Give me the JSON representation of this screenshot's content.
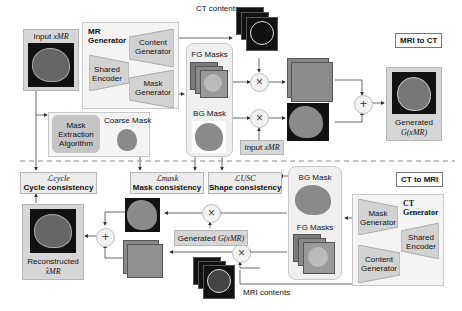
{
  "top": {
    "section_label": "MRI to CT",
    "input_label": "Input",
    "input_math": "xMR",
    "generator_title_1": "MR",
    "generator_title_2": "Generator",
    "content_generator": [
      "Content",
      "Generator"
    ],
    "shared_encoder": [
      "Shared",
      "Encoder"
    ],
    "mask_generator": [
      "Mask",
      "Generator"
    ],
    "ct_contents": "CT contents",
    "fg_masks": "FG Masks",
    "bg_mask": "BG Mask",
    "coarse_mask": "Coarse Mask",
    "mask_extraction": [
      "Mask",
      "Extraction",
      "Algorithm"
    ],
    "input2_label": "Input",
    "input2_math": "xMR",
    "generated_label": "Generated",
    "generated_math": "G(xMR)",
    "multiply_symbol": "×",
    "add_symbol": "+"
  },
  "losses": {
    "cycle": {
      "math": "ℒcycle",
      "label": "Cycle consistency"
    },
    "mask": {
      "math": "ℒmask",
      "label": "Mask consistency"
    },
    "shape": {
      "math": "ℒUSC",
      "label": "Shape consistency"
    }
  },
  "bottom": {
    "section_label": "CT to MRI",
    "generator_title_1": "CT",
    "generator_title_2": "Generator",
    "mask_generator": [
      "Mask",
      "Generator"
    ],
    "shared_encoder": [
      "Shared",
      "Encoder"
    ],
    "content_generator": [
      "Content",
      "Generator"
    ],
    "bg_mask": "BG Mask",
    "fg_masks": "FG Masks",
    "generated_label": "Generated",
    "generated_math": "G(xMR)",
    "mri_contents": "MRI contents",
    "reconstructed_label": "Reconstructed",
    "reconstructed_math": "x̂MR",
    "multiply_symbol": "×",
    "add_symbol": "+"
  }
}
